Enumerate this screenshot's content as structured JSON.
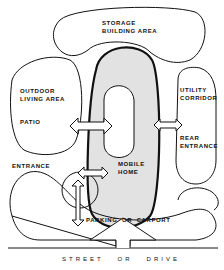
{
  "diagram": {
    "type": "site-plan bubble diagram",
    "zones": {
      "storage": [
        "STORAGE",
        "BUILDING AREA"
      ],
      "outdoor": [
        "OUTDOOR",
        "LIVING AREA"
      ],
      "patio": "PATIO",
      "utility": [
        "UTILITY",
        "CORRIDOR"
      ],
      "rear_entrance": [
        "REAR",
        "ENTRANCE"
      ],
      "entrance": "ENTRANCE",
      "mobile_home": [
        "MOBILE",
        "HOME"
      ],
      "parking": "PARKING  OR  CARPORT",
      "street": "STREET   OR   DRIVE"
    },
    "colors": {
      "line": "#111111",
      "home_fill": "#e2e2e2",
      "background": "#ffffff"
    }
  }
}
